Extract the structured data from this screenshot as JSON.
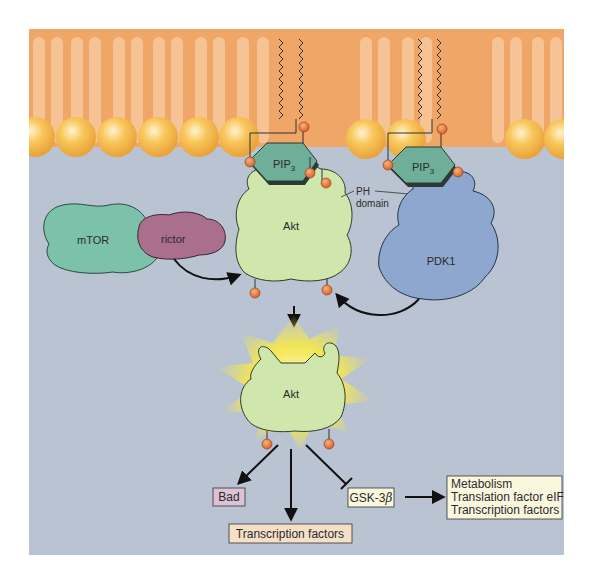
{
  "diagram": {
    "type": "signaling-pathway",
    "title": "",
    "colors": {
      "background": "#ffffff",
      "cytoplasm": "#b9c3d1",
      "membrane": "#f0a666",
      "lipid_tail": "#f6c79a",
      "head_group": "#f5b94a",
      "pip3": "#6fae98",
      "akt": "#cfe6ad",
      "pdk1": "#8ea7cf",
      "mtor": "#7cc2aa",
      "rictor": "#a96f8c",
      "phosphate": "#e57a3a",
      "glow": "#f5e64a",
      "bad_box": "#dcc2d6",
      "tf_box": "#f5dfc6",
      "gsk_box": "#fbf7df",
      "outcome_box": "#fbf7df"
    },
    "membrane": {
      "pip3_left": {
        "label": "PIP",
        "subscript": "3"
      },
      "pip3_right": {
        "label": "PIP",
        "subscript": "3"
      }
    },
    "proteins": {
      "mtor": "mTOR",
      "rictor": "rictor",
      "akt_inactive": "Akt",
      "pdk1": "PDK1",
      "akt_active": "Akt"
    },
    "annotations": {
      "ph_domain_line1": "PH",
      "ph_domain_line2": "domain"
    },
    "phosphate_label": "P",
    "targets": {
      "bad": "Bad",
      "transcription_factors": "Transcription factors",
      "gsk3b_prefix": "GSK-3",
      "gsk3b_greek": "β"
    },
    "outcomes": [
      "Metabolism",
      "Translation factor eIF2B",
      "Transcription factors"
    ]
  }
}
